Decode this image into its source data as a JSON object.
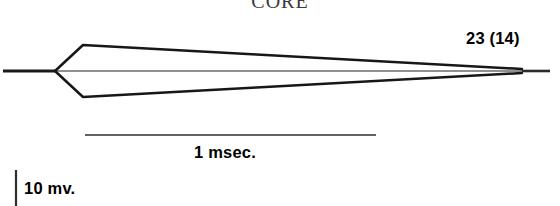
{
  "figure": {
    "panel_title": "CORE",
    "amplitude_label": "23 (14)",
    "time_scale_label": "1 msec.",
    "voltage_scale_label": "10 mv.",
    "background_color": "#ffffff",
    "trace_color": "#1a1a1a",
    "baseline_color": "#4a4a4a"
  },
  "chart_data": {
    "type": "line",
    "title": "CORE",
    "xlabel": "1 msec.",
    "ylabel": "10 mv.",
    "grid": false,
    "legend": null,
    "annotations": [
      {
        "text": "23 (14)",
        "x": 466,
        "y": 30,
        "role": "response-amplitude-label"
      },
      {
        "text": "1 msec.",
        "x": 194,
        "y": 144,
        "role": "time-calibration-label"
      },
      {
        "text": "10 mv.",
        "x": 24,
        "y": 180,
        "role": "voltage-calibration-label"
      }
    ],
    "scale_bars": {
      "time": {
        "label": "1 msec.",
        "x1": 85,
        "x2": 376,
        "y": 135,
        "length_px": 291
      },
      "voltage": {
        "label": "10 mv.",
        "x": 16,
        "y1": 170,
        "y2": 206,
        "length_px": 36
      }
    },
    "axis_ranges": {
      "x_px": [
        0,
        560
      ],
      "y_px": [
        0,
        206
      ]
    },
    "baseline_y_px": 71,
    "series": [
      {
        "name": "baseline-left",
        "role": "pre-stimulus baseline",
        "points": [
          [
            3,
            71
          ],
          [
            55,
            71
          ]
        ]
      },
      {
        "name": "baseline-through",
        "role": "zero reference line",
        "points": [
          [
            55,
            71
          ],
          [
            550,
            71
          ]
        ]
      },
      {
        "name": "upper-deflection",
        "role": "positive-going sweep trace",
        "points": [
          [
            55,
            71
          ],
          [
            83,
            45
          ],
          [
            522,
            69
          ]
        ]
      },
      {
        "name": "lower-deflection",
        "role": "negative-going sweep trace",
        "points": [
          [
            55,
            71
          ],
          [
            83,
            97
          ],
          [
            522,
            73
          ]
        ]
      },
      {
        "name": "baseline-right",
        "role": "post-sweep baseline",
        "points": [
          [
            522,
            71
          ],
          [
            550,
            71
          ]
        ]
      }
    ]
  }
}
